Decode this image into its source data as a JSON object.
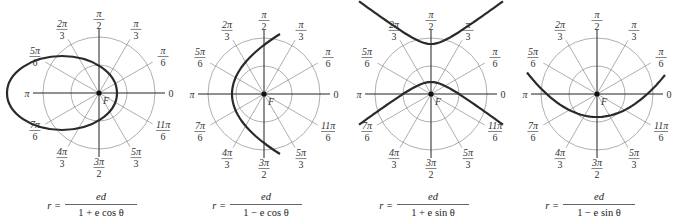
{
  "figure": {
    "colors": {
      "grid": "#9a9a9a",
      "axis": "#222222",
      "curve": "#2a2a2a",
      "label": "#333333"
    },
    "focus_label": "F",
    "angle_labels": [
      {
        "angle_deg": 0,
        "num": "0",
        "den": ""
      },
      {
        "angle_deg": 30,
        "num": "π",
        "den": "6"
      },
      {
        "angle_deg": 60,
        "num": "π",
        "den": "3"
      },
      {
        "angle_deg": 90,
        "num": "π",
        "den": "2"
      },
      {
        "angle_deg": 120,
        "num": "2π",
        "den": "3"
      },
      {
        "angle_deg": 150,
        "num": "5π",
        "den": "6"
      },
      {
        "angle_deg": 180,
        "num": "π",
        "den": ""
      },
      {
        "angle_deg": 210,
        "num": "7π",
        "den": "6"
      },
      {
        "angle_deg": 240,
        "num": "4π",
        "den": "3"
      },
      {
        "angle_deg": 270,
        "num": "3π",
        "den": "2"
      },
      {
        "angle_deg": 300,
        "num": "5π",
        "den": "3"
      },
      {
        "angle_deg": 330,
        "num": "11π",
        "den": "6"
      }
    ],
    "panels": [
      {
        "id": "p1",
        "cx": 99,
        "cy": 93,
        "conic": "ellipse",
        "formula_lhs": "r =",
        "formula_num": "ed",
        "formula_den": "1 + e cos θ"
      },
      {
        "id": "p2",
        "cx": 264,
        "cy": 94,
        "conic": "parabola-right",
        "formula_lhs": "r =",
        "formula_num": "ed",
        "formula_den": "1 − e cos θ"
      },
      {
        "id": "p3",
        "cx": 431,
        "cy": 94,
        "conic": "hyperbola-vertical",
        "formula_lhs": "r =",
        "formula_num": "ed",
        "formula_den": "1 + e sin θ"
      },
      {
        "id": "p4",
        "cx": 597,
        "cy": 94,
        "conic": "parabola-up",
        "formula_lhs": "r =",
        "formula_num": "ed",
        "formula_den": "1 − e sin θ"
      }
    ]
  }
}
